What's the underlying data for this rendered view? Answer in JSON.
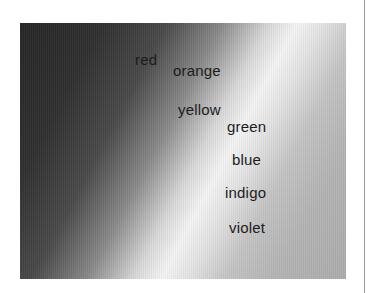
{
  "figure": {
    "labels": [
      {
        "text": "red",
        "x": 135,
        "y": 52
      },
      {
        "text": "orange",
        "x": 173,
        "y": 63
      },
      {
        "text": "yellow",
        "x": 178,
        "y": 102
      },
      {
        "text": "green",
        "x": 227,
        "y": 119
      },
      {
        "text": "blue",
        "x": 232,
        "y": 152
      },
      {
        "text": "indigo",
        "x": 225,
        "y": 185
      },
      {
        "text": "violet",
        "x": 229,
        "y": 220
      }
    ]
  }
}
